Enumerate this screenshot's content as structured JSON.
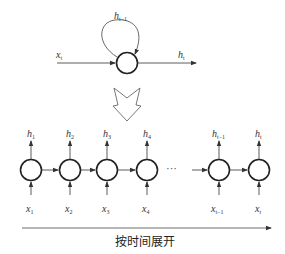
{
  "diagram": {
    "title_type": "RNN unrolled through time",
    "folded": {
      "input_label": "x",
      "input_sub": "t",
      "output_label": "h",
      "output_sub": "t",
      "loop_label": "h",
      "loop_sub": "t−1"
    },
    "unrolled": {
      "cells": [
        {
          "h": "h",
          "h_sub": "1",
          "x": "x",
          "x_sub": "1"
        },
        {
          "h": "h",
          "h_sub": "2",
          "x": "x",
          "x_sub": "2"
        },
        {
          "h": "h",
          "h_sub": "3",
          "x": "x",
          "x_sub": "3"
        },
        {
          "h": "h",
          "h_sub": "4",
          "x": "x",
          "x_sub": "4"
        },
        {
          "h": "h",
          "h_sub": "t−1",
          "x": "x",
          "x_sub": "t−1"
        },
        {
          "h": "h",
          "h_sub": "t",
          "x": "x",
          "x_sub": "t"
        }
      ],
      "ellipsis": "···"
    },
    "timeline_label": "按时间展开",
    "colors": {
      "stroke": "#333333",
      "background": "#ffffff"
    }
  }
}
